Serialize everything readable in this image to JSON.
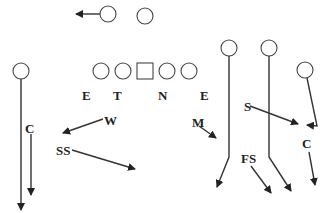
{
  "diagram": {
    "type": "football-play-diagram",
    "offense": {
      "backfield": [
        "motion-back",
        "back"
      ],
      "line": [
        "lineman",
        "lineman",
        "center",
        "lineman",
        "lineman"
      ],
      "receivers": [
        "left-wide-receiver",
        "inside-receiver-1",
        "inside-receiver-2",
        "right-receiver"
      ]
    },
    "defense_labels": {
      "end_left": "E",
      "tackle": "T",
      "nose": "N",
      "end_right": "E",
      "corner_left": "C",
      "will": "W",
      "strong_safety": "SS",
      "mike": "M",
      "sam": "S",
      "free_safety": "FS",
      "corner_right": "C"
    }
  }
}
